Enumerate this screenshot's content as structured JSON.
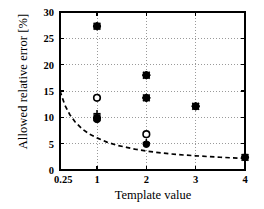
{
  "chart_data": {
    "type": "scatter",
    "title": "",
    "xlabel": "Template value",
    "ylabel": "Allowed relative error [%]",
    "xlim": [
      0.25,
      4
    ],
    "ylim": [
      0,
      30
    ],
    "xticks": [
      "0.25",
      "1",
      "2",
      "3",
      "4"
    ],
    "xtick_values": [
      0.25,
      1,
      2,
      3,
      4
    ],
    "yticks": [
      "0",
      "5",
      "10",
      "15",
      "20",
      "25",
      "30"
    ],
    "ytick_values": [
      0,
      5,
      10,
      15,
      20,
      25,
      30
    ],
    "grid": "dotted",
    "legend": "none",
    "points": [
      {
        "x": 1,
        "y": 27.3,
        "marker": "filled-circle-star"
      },
      {
        "x": 1,
        "y": 13.7,
        "marker": "open-circle"
      },
      {
        "x": 1,
        "y": 10.7,
        "marker": "plus"
      },
      {
        "x": 1,
        "y": 9.9,
        "marker": "filled-circle-star"
      },
      {
        "x": 1,
        "y": 9.6,
        "marker": "filled-circle"
      },
      {
        "x": 2,
        "y": 18.0,
        "marker": "filled-circle-star"
      },
      {
        "x": 2,
        "y": 13.7,
        "marker": "filled-circle-star"
      },
      {
        "x": 2,
        "y": 6.8,
        "marker": "open-circle"
      },
      {
        "x": 2,
        "y": 5.2,
        "marker": "plus"
      },
      {
        "x": 2,
        "y": 4.9,
        "marker": "filled-circle"
      },
      {
        "x": 3,
        "y": 12.1,
        "marker": "filled-circle-star"
      },
      {
        "x": 4,
        "y": 2.4,
        "marker": "filled-circle-star"
      }
    ],
    "curve": {
      "style": "dashed",
      "label": "",
      "x": [
        0.25,
        0.35,
        0.45,
        0.55,
        0.7,
        0.85,
        1.0,
        1.2,
        1.4,
        1.6,
        1.8,
        2.0,
        2.25,
        2.5,
        2.75,
        3.0,
        3.25,
        3.5,
        3.75,
        4.0
      ],
      "y": [
        15.0,
        12.3,
        10.5,
        9.2,
        7.8,
        6.8,
        6.1,
        5.3,
        4.7,
        4.3,
        3.9,
        3.6,
        3.3,
        3.05,
        2.85,
        2.7,
        2.55,
        2.42,
        2.3,
        2.2
      ]
    },
    "colors": {
      "axis": "#000000",
      "marker": "#000000",
      "grid": "#9a9a9a",
      "curve": "#000000",
      "background": "#ffffff"
    }
  }
}
